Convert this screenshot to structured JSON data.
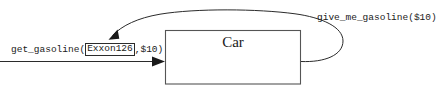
{
  "diagram": {
    "type": "object-interaction-diagram",
    "background_color": "#ffffff",
    "line_color": "#2b2b2b",
    "box_border_color": "#555555",
    "width": 437,
    "height": 93,
    "class_box": {
      "name": "Car",
      "x": 165,
      "y": 30,
      "width": 136,
      "height": 54
    },
    "incoming_message": {
      "full_label": "get_gasoline(Exxon126,$10)",
      "prefix_text": "get_gasoline(",
      "object_reference": "Exxon126",
      "suffix_text": ",$10)",
      "arrow_direction": "right",
      "arrowhead": "filled"
    },
    "return_message": {
      "full_label": "give_me_gasoline($10)",
      "arrow_direction": "loop-back-left",
      "arrowhead": "filled",
      "target": "Exxon126"
    }
  }
}
